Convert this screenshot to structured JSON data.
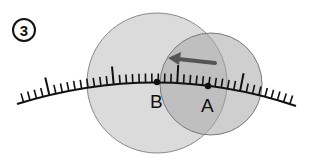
{
  "step": {
    "number": "3"
  },
  "diagram": {
    "points": [
      {
        "label": "B",
        "x": 157,
        "y": 82
      },
      {
        "label": "A",
        "x": 208,
        "y": 86
      }
    ],
    "circles": [
      {
        "name": "large-circle",
        "cx": 157,
        "cy": 83,
        "r": 70,
        "fill": "#c8c8c8"
      },
      {
        "name": "small-circle",
        "cx": 211,
        "cy": 84,
        "r": 51,
        "fill": "#b0b0b0"
      }
    ],
    "arrow": {
      "direction": "left",
      "from": [
        215,
        63
      ],
      "to": [
        170,
        58
      ],
      "color": "#555555"
    },
    "colors": {
      "line": "#111111",
      "circle_stroke": "#888888"
    }
  }
}
